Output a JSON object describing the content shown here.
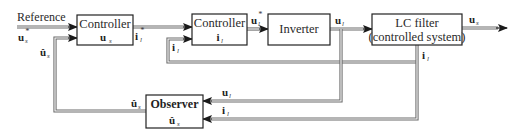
{
  "diagram": {
    "type": "block-diagram",
    "blocks": [
      {
        "id": "controller_us",
        "title": "Controller",
        "symbol": "u",
        "subscript": "s"
      },
      {
        "id": "controller_il",
        "title": "Controller",
        "symbol": "i",
        "subscript": "l"
      },
      {
        "id": "inverter",
        "title": "Inverter"
      },
      {
        "id": "lc_filter",
        "title": "LC filter",
        "subtitle": "(controlled system)"
      },
      {
        "id": "observer",
        "title": "Observer",
        "symbol": "û",
        "subscript": "s"
      }
    ],
    "signals": {
      "reference_label": "Reference",
      "us_ref": {
        "symbol": "u",
        "subscript": "s",
        "superscript": "*"
      },
      "us_hat_feedback": {
        "symbol": "û",
        "subscript": "s"
      },
      "il_ref": {
        "symbol": "i",
        "subscript": "l",
        "superscript": "*"
      },
      "il_feedback": {
        "symbol": "i",
        "subscript": "l"
      },
      "ul_ref": {
        "symbol": "u",
        "subscript": "l",
        "superscript": "*"
      },
      "ul": {
        "symbol": "u",
        "subscript": "l"
      },
      "us_out": {
        "symbol": "u",
        "subscript": "s"
      },
      "il_out": {
        "symbol": "i",
        "subscript": "l"
      },
      "obs_us_hat": {
        "symbol": "û",
        "subscript": "s"
      },
      "obs_in_ul": {
        "symbol": "u",
        "subscript": "l"
      },
      "obs_in_il": {
        "symbol": "i",
        "subscript": "l"
      }
    },
    "connections": [
      {
        "from": "Reference",
        "to": "controller_us",
        "label": "u_s*"
      },
      {
        "from": "observer",
        "to": "controller_us",
        "label": "û_s"
      },
      {
        "from": "controller_us",
        "to": "controller_il",
        "label": "i_l*"
      },
      {
        "from": "lc_filter",
        "to": "controller_il",
        "label": "i_l"
      },
      {
        "from": "controller_il",
        "to": "inverter",
        "label": "u_l*"
      },
      {
        "from": "inverter",
        "to": "lc_filter",
        "label": "u_l"
      },
      {
        "from": "lc_filter",
        "to": "output",
        "label": "u_s"
      },
      {
        "from": "inverter",
        "to": "observer",
        "label": "u_l"
      },
      {
        "from": "lc_filter",
        "to": "observer",
        "label": "i_l"
      }
    ]
  }
}
